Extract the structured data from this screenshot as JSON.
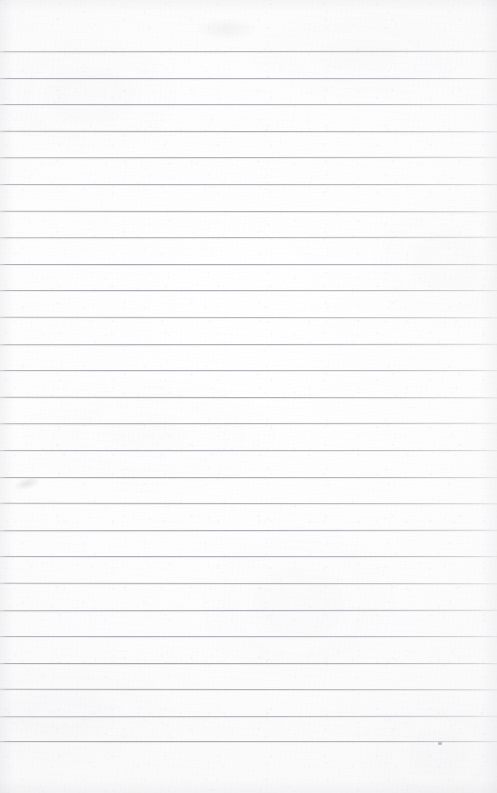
{
  "document": {
    "kind": "scanned-ruled-notebook-page",
    "title": "Blank lined page",
    "content_text": "",
    "page_width": 497,
    "page_height": 793
  },
  "paper": {
    "background_color": "#fbfbfc",
    "highlight_color": "#ffffff",
    "edge_tint_color": "#f6f6f7"
  },
  "ruling": {
    "line_color": "#a8a8af",
    "line_thickness": 1,
    "first_line_y": 51,
    "line_spacing": 26.6,
    "line_count": 27,
    "left_inset": 0,
    "right_inset": 0,
    "top_margin": 51,
    "bottom_margin": 53,
    "has_vertical_margin_rule": false,
    "line_positions": [
      51,
      77.6,
      104.2,
      130.8,
      157.4,
      184,
      210.6,
      237.2,
      263.8,
      290.4,
      317,
      343.6,
      370.2,
      396.8,
      423.4,
      450,
      476.6,
      503.2,
      529.8,
      556.4,
      583,
      609.6,
      636.2,
      662.8,
      689.4,
      716,
      740.8
    ]
  },
  "artifacts": [
    {
      "id": "speck-bottom-right",
      "name": "dust-speck",
      "x": 438,
      "y": 742,
      "color": "#96969e"
    },
    {
      "id": "smudge-left",
      "name": "paper-smudge",
      "x": 14,
      "y": 478,
      "color": "#c4c4ca"
    },
    {
      "id": "smudge-top",
      "name": "paper-blotch",
      "x": 196,
      "y": 18,
      "color": "#c8c8ce"
    }
  ]
}
